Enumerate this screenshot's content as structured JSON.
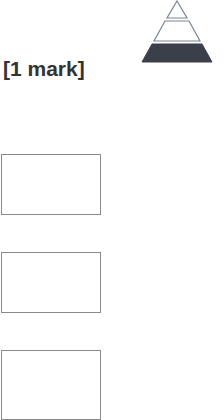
{
  "question": {
    "marks_label": "[1 mark]"
  },
  "pyramid_icon": {
    "name": "difficulty-pyramid-icon",
    "levels": 3,
    "filled_level": "bottom",
    "fill_color": "#3a3f4a",
    "outline_color": "#7a8594"
  },
  "answer_boxes": [
    {
      "value": ""
    },
    {
      "value": ""
    },
    {
      "value": ""
    }
  ]
}
